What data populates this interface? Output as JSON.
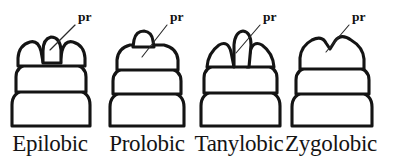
{
  "figure": {
    "name": "head-lobe-morphology-plate",
    "background_color": "#ffffff",
    "ink_color": "#141414",
    "leader_color": "#2a2a2a",
    "panel_count": 4,
    "callout_text": "pr"
  },
  "panels": [
    {
      "id": "epilobic",
      "label": "Epilobic",
      "callout": "pr",
      "label_x": 50,
      "label_y": 151,
      "pr_x": 78,
      "pr_y": 21,
      "leader": "M 75 25 L 50 50"
    },
    {
      "id": "prolobic",
      "label": "Prolobic",
      "callout": "pr",
      "label_x": 147,
      "label_y": 151,
      "pr_x": 170,
      "pr_y": 21,
      "leader": "M 167 25 L 142 57"
    },
    {
      "id": "tanylobic",
      "label": "Tanylobic",
      "callout": "pr",
      "label_x": 239,
      "label_y": 151,
      "pr_x": 263,
      "pr_y": 21,
      "leader": "M 260 25 L 236 53"
    },
    {
      "id": "zygolobic",
      "label": "Zygolobic",
      "callout": "pr",
      "label_x": 331,
      "label_y": 151,
      "pr_x": 352,
      "pr_y": 21,
      "leader": "M 349 25 L 326 52"
    }
  ]
}
